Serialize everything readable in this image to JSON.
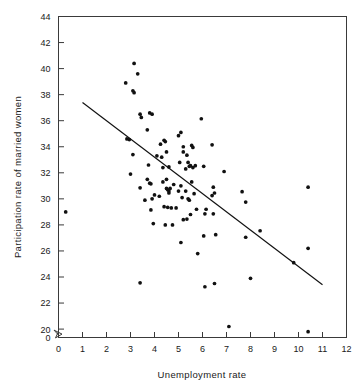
{
  "chart_data": {
    "type": "scatter",
    "title": "",
    "xlabel": "Unemployment rate",
    "ylabel": "Participation rate of married women",
    "xlim": [
      0,
      12
    ],
    "ylim": [
      18.8,
      44
    ],
    "grid": false,
    "legend": null,
    "x_ticks": [
      "0",
      "1",
      "2",
      "3",
      "4",
      "5",
      "6",
      "7",
      "8",
      "9",
      "10",
      "11",
      "12"
    ],
    "y_ticks": [
      "0",
      "20",
      "22",
      "24",
      "26",
      "28",
      "30",
      "32",
      "34",
      "36",
      "38",
      "40",
      "42",
      "44"
    ],
    "y_axis_break": true,
    "y_axis_break_note": "zigzag break between 0 and 20",
    "marker_color": "#111111",
    "line_color": "#111111",
    "series": [
      {
        "name": "observations",
        "type": "scatter",
        "points": [
          [
            0.3,
            29.0
          ],
          [
            2.8,
            38.9
          ],
          [
            3.15,
            40.4
          ],
          [
            3.1,
            38.3
          ],
          [
            3.15,
            38.15
          ],
          [
            3.3,
            39.6
          ],
          [
            2.85,
            34.6
          ],
          [
            2.95,
            34.55
          ],
          [
            3.1,
            33.4
          ],
          [
            3.0,
            31.9
          ],
          [
            3.4,
            36.5
          ],
          [
            3.45,
            36.25
          ],
          [
            3.8,
            36.6
          ],
          [
            3.9,
            36.5
          ],
          [
            3.4,
            30.85
          ],
          [
            3.4,
            23.55
          ],
          [
            3.7,
            35.3
          ],
          [
            3.75,
            32.6
          ],
          [
            3.8,
            31.2
          ],
          [
            3.85,
            31.15
          ],
          [
            3.7,
            31.5
          ],
          [
            3.9,
            30.0
          ],
          [
            3.85,
            29.15
          ],
          [
            3.95,
            28.1
          ],
          [
            4.1,
            33.3
          ],
          [
            4.25,
            34.2
          ],
          [
            4.3,
            33.2
          ],
          [
            4.4,
            34.5
          ],
          [
            4.45,
            34.4
          ],
          [
            4.5,
            33.6
          ],
          [
            4.35,
            31.3
          ],
          [
            4.5,
            31.5
          ],
          [
            4.5,
            30.8
          ],
          [
            4.55,
            30.7
          ],
          [
            4.6,
            30.6
          ],
          [
            4.6,
            30.45
          ],
          [
            4.65,
            30.8
          ],
          [
            4.4,
            29.4
          ],
          [
            4.55,
            29.35
          ],
          [
            4.35,
            32.4
          ],
          [
            4.6,
            32.45
          ],
          [
            4.7,
            29.3
          ],
          [
            4.75,
            28.0
          ],
          [
            4.45,
            28.0
          ],
          [
            5.0,
            34.85
          ],
          [
            5.1,
            35.1
          ],
          [
            5.2,
            33.6
          ],
          [
            5.2,
            34.0
          ],
          [
            5.35,
            33.35
          ],
          [
            5.4,
            32.8
          ],
          [
            5.45,
            32.5
          ],
          [
            5.5,
            32.55
          ],
          [
            5.3,
            32.3
          ],
          [
            5.1,
            31.0
          ],
          [
            5.0,
            30.6
          ],
          [
            5.15,
            30.1
          ],
          [
            5.3,
            30.6
          ],
          [
            5.4,
            30.0
          ],
          [
            5.45,
            29.9
          ],
          [
            5.2,
            28.4
          ],
          [
            5.35,
            28.45
          ],
          [
            5.1,
            26.65
          ],
          [
            5.55,
            34.1
          ],
          [
            5.6,
            33.95
          ],
          [
            5.6,
            32.4
          ],
          [
            5.7,
            32.55
          ],
          [
            5.65,
            30.4
          ],
          [
            5.5,
            28.8
          ],
          [
            5.75,
            29.2
          ],
          [
            5.8,
            25.8
          ],
          [
            5.95,
            36.15
          ],
          [
            6.05,
            32.5
          ],
          [
            6.1,
            28.85
          ],
          [
            6.05,
            27.15
          ],
          [
            6.1,
            23.25
          ],
          [
            6.4,
            34.15
          ],
          [
            6.45,
            30.9
          ],
          [
            6.4,
            30.25
          ],
          [
            6.5,
            30.45
          ],
          [
            6.45,
            28.85
          ],
          [
            6.55,
            27.25
          ],
          [
            6.5,
            23.5
          ],
          [
            6.9,
            32.1
          ],
          [
            7.1,
            20.2
          ],
          [
            7.65,
            30.55
          ],
          [
            7.8,
            29.75
          ],
          [
            7.8,
            27.05
          ],
          [
            8.0,
            23.9
          ],
          [
            8.4,
            27.55
          ],
          [
            9.8,
            25.1
          ],
          [
            10.4,
            30.9
          ],
          [
            10.4,
            26.2
          ],
          [
            10.4,
            19.8
          ],
          [
            4.0,
            30.3
          ],
          [
            4.9,
            29.3
          ],
          [
            5.55,
            31.3
          ],
          [
            6.15,
            29.2
          ],
          [
            4.2,
            30.2
          ],
          [
            5.05,
            32.8
          ],
          [
            3.6,
            29.9
          ],
          [
            4.8,
            31.1
          ]
        ]
      },
      {
        "name": "fitted-regression-line",
        "type": "line",
        "endpoints": [
          [
            1.0,
            37.4
          ],
          [
            11.0,
            23.4
          ]
        ]
      }
    ]
  }
}
